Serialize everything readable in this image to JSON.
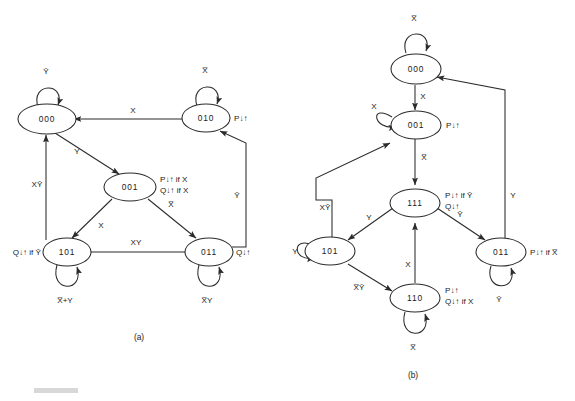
{
  "figure": {
    "caption_a": "(a)",
    "caption_b": "(b)",
    "colors": {
      "ink": "#2b2b2b",
      "paper": "#ffffff"
    }
  },
  "diagram_a": {
    "name": "state-diagram-a",
    "states": [
      {
        "id": "a-000",
        "label": "000",
        "outputs": []
      },
      {
        "id": "a-010",
        "label": "010",
        "outputs": [
          "P↓↑"
        ]
      },
      {
        "id": "a-001",
        "label": "001",
        "outputs": [
          "P↓↑ if X",
          "Q↓↑ if X"
        ]
      },
      {
        "id": "a-101",
        "label": "101",
        "outputs": [
          "Q↓↑ if Ȳ"
        ]
      },
      {
        "id": "a-011",
        "label": "011",
        "outputs": [
          "Q↓↑"
        ]
      }
    ],
    "self_loops": [
      {
        "state": "000",
        "condition": "Ȳ"
      },
      {
        "state": "010",
        "condition": "X̅"
      },
      {
        "state": "101",
        "condition": "X̅+Y"
      },
      {
        "state": "011",
        "condition": "X̅Y"
      }
    ],
    "transitions": [
      {
        "from": "010",
        "to": "000",
        "condition": "X"
      },
      {
        "from": "000",
        "to": "001",
        "condition": "Y"
      },
      {
        "from": "001",
        "to": "101",
        "condition": "X"
      },
      {
        "from": "001",
        "to": "011",
        "condition": "X̅"
      },
      {
        "from": "011",
        "to": "101",
        "condition": "XY"
      },
      {
        "from": "011",
        "to": "010",
        "condition": "Ȳ"
      },
      {
        "from": "101",
        "to": "000",
        "condition": "XȲ"
      }
    ]
  },
  "diagram_b": {
    "name": "state-diagram-b",
    "states": [
      {
        "id": "b-000",
        "label": "000",
        "outputs": []
      },
      {
        "id": "b-001",
        "label": "001",
        "outputs": [
          "P↓↑"
        ]
      },
      {
        "id": "b-111",
        "label": "111",
        "outputs": [
          "P↓↑ if Ȳ",
          "Q↓↑"
        ]
      },
      {
        "id": "b-101",
        "label": "101",
        "outputs": []
      },
      {
        "id": "b-110",
        "label": "110",
        "outputs": [
          "P↓↑",
          "Q↓↑ if X"
        ]
      },
      {
        "id": "b-011",
        "label": "011",
        "outputs": [
          "P↓↑ if X̅"
        ]
      }
    ],
    "self_loops": [
      {
        "state": "000",
        "condition": "X̅"
      },
      {
        "state": "001",
        "condition": "X"
      },
      {
        "state": "101",
        "condition": "Y"
      },
      {
        "state": "110",
        "condition": "X̅"
      },
      {
        "state": "011",
        "condition": "Ȳ"
      }
    ],
    "transitions": [
      {
        "from": "000",
        "to": "001",
        "condition": "X"
      },
      {
        "from": "001",
        "to": "111",
        "condition": "X̅"
      },
      {
        "from": "111",
        "to": "101",
        "condition": "Y"
      },
      {
        "from": "111",
        "to": "011",
        "condition": "Ȳ"
      },
      {
        "from": "101",
        "to": "001",
        "condition": "XȲ"
      },
      {
        "from": "101",
        "to": "110",
        "condition": "X̅Ȳ"
      },
      {
        "from": "110",
        "to": "111",
        "condition": "X"
      },
      {
        "from": "011",
        "to": "000",
        "condition": "Y"
      }
    ]
  }
}
